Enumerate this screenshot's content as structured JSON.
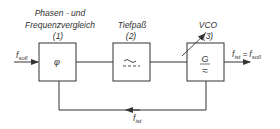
{
  "diagram": {
    "blocks": [
      {
        "id": "1",
        "label_line1": "Phasen - und",
        "label_line2": "Frequenzvergleich",
        "number": "(1)",
        "symbol": "φ"
      },
      {
        "id": "2",
        "label_line1": "Tiefpaß",
        "number": "(2)",
        "symbol": "lowpass-filter"
      },
      {
        "id": "3",
        "label_line1": "VCO",
        "number": "(3)",
        "symbol_top": "G",
        "symbol_bottom": "≈"
      }
    ],
    "signals": {
      "input_main": "f",
      "input_sub": "soll",
      "output_main1": "f",
      "output_sub1": "ist",
      "output_eq": "=",
      "output_main2": "f",
      "output_sub2": "soll",
      "feedback_main": "f",
      "feedback_sub": "ist"
    },
    "colors": {
      "line": "#333333",
      "background": "#ffffff"
    }
  }
}
